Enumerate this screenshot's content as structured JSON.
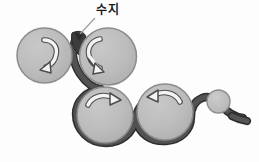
{
  "figure": {
    "domain_kind": "biology-diagram",
    "canvas": {
      "width": 259,
      "height": 162
    },
    "background_color": "#fdfdfd"
  },
  "palette": {
    "sphere_fill": "#b9b9b9",
    "sphere_fill_highlight": "#c9c9c9",
    "sphere_outline": "#8a8a8a",
    "strand_dark": "#4a4a4a",
    "strand_edge": "#2e2e2e",
    "arrow_fill": "#f2f2f2",
    "arrow_outline": "#4d4d4d",
    "label_color": "#1a1a1a",
    "leader_line_color": "#9a9a9a"
  },
  "callout": {
    "label": "수지",
    "label_x": 96,
    "label_y": 4,
    "leader_from_x": 95,
    "leader_from_y": 18,
    "leader_to_x": 79,
    "leader_to_y": 35,
    "arrowhead_x": 78,
    "arrowhead_y": 36
  },
  "spheres": [
    {
      "id": "sphere-1",
      "cx": 44.5,
      "cy": 55.5,
      "r": 27.5,
      "arrow": "curved-arrow-clockwise-down"
    },
    {
      "id": "sphere-2",
      "cx": 108.0,
      "cy": 56.5,
      "r": 28.5,
      "arrow": "curved-arrow-counterclockwise-down"
    },
    {
      "id": "sphere-3",
      "cx": 105.0,
      "cy": 115.0,
      "r": 28.0,
      "arrow": "curved-arrow-right"
    },
    {
      "id": "sphere-4",
      "cx": 165.0,
      "cy": 112.0,
      "r": 28.0,
      "arrow": "curved-arrow-left"
    },
    {
      "id": "sphere-5",
      "cx": 218.5,
      "cy": 101.5,
      "r": 11.5,
      "arrow": "none"
    }
  ],
  "strand": {
    "description": "dark winding fiber threading between spheres",
    "width_px": 7,
    "tail_end_x": 247,
    "tail_end_y": 121
  }
}
